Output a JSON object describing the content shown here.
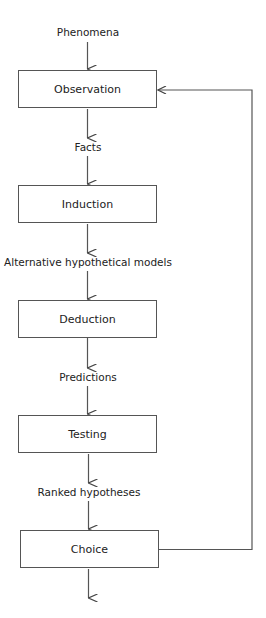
{
  "diagram": {
    "type": "flowchart",
    "title": "",
    "input_label": "Phenomena",
    "steps": [
      {
        "label": "Observation"
      },
      {
        "label": "Induction"
      },
      {
        "label": "Deduction"
      },
      {
        "label": "Testing"
      },
      {
        "label": "Choice"
      }
    ],
    "edge_labels": [
      "Facts",
      "Alternative hypothetical models",
      "Predictions",
      "Ranked hypotheses"
    ],
    "feedback": {
      "from": "Choice",
      "to": "Observation"
    },
    "line_color": "#555555"
  }
}
